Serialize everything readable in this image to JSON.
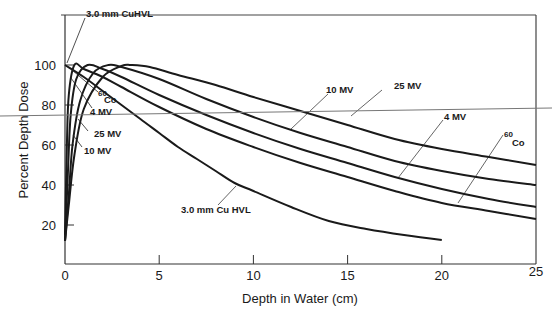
{
  "chart_data": {
    "type": "line",
    "title": "",
    "xlabel": "Depth in Water (cm)",
    "ylabel": "Percent Depth Dose",
    "xlim": [
      0,
      25
    ],
    "ylim": [
      0,
      110
    ],
    "x_ticks": [
      0,
      5,
      10,
      15,
      20,
      25
    ],
    "y_ticks": [
      20,
      40,
      60,
      80,
      100
    ],
    "grid": false,
    "legend": "inline labels with leader lines",
    "series": [
      {
        "name": "3.0 mm Cu HVL",
        "label_top": "3.0 mm CuHVL",
        "label_bottom": "3.0 mm Cu HVL",
        "x": [
          0,
          1,
          2,
          3,
          4,
          5,
          6,
          7,
          8,
          9,
          10,
          12,
          14,
          16,
          18,
          20
        ],
        "values": [
          100,
          94,
          87,
          80,
          73,
          66,
          59,
          53,
          47,
          41,
          37,
          29,
          22,
          18,
          15,
          12.5
        ]
      },
      {
        "name": "60Co",
        "label_sup": "60",
        "label_main": "Co",
        "x": [
          0,
          0.1,
          0.2,
          0.5,
          1,
          2,
          3,
          5,
          7.5,
          10,
          12.5,
          15,
          17.5,
          20,
          22.5,
          25
        ],
        "values": [
          15,
          60,
          85,
          100,
          98,
          94,
          89,
          79,
          68,
          59,
          51,
          44,
          37,
          31,
          27,
          23
        ]
      },
      {
        "name": "4 MV",
        "x": [
          0,
          0.15,
          0.3,
          0.6,
          1.2,
          2,
          3,
          5,
          7.5,
          10,
          12.5,
          15,
          17.5,
          20,
          22.5,
          25
        ],
        "values": [
          12,
          45,
          75,
          93,
          100,
          98,
          94,
          85,
          75,
          66,
          58,
          51,
          44,
          38,
          33,
          29
        ]
      },
      {
        "name": "10 MV",
        "x": [
          0,
          0.2,
          0.4,
          0.8,
          1.5,
          2.3,
          3,
          5,
          7.5,
          10,
          12.5,
          15,
          17.5,
          20,
          22.5,
          25
        ],
        "values": [
          12,
          35,
          60,
          82,
          96,
          100,
          99,
          93,
          83,
          74,
          66,
          59,
          52,
          47,
          43,
          40
        ]
      },
      {
        "name": "25 MV",
        "x": [
          0,
          0.2,
          0.5,
          1,
          2,
          3,
          3.5,
          4.5,
          6,
          8,
          10,
          12.5,
          15,
          17.5,
          20,
          22.5,
          25
        ],
        "values": [
          12,
          30,
          55,
          78,
          94,
          99.5,
          100,
          99,
          95,
          90,
          84,
          77,
          70,
          63,
          58,
          54,
          50
        ]
      }
    ],
    "annotations": [
      {
        "text": "3.0 mm CuHVL",
        "points_to": "3.0 mm Cu HVL curve at depth 0 (100%)"
      },
      {
        "text": "60 Co",
        "points_to": "60Co build-up region"
      },
      {
        "text": "4 MV",
        "points_to": "4 MV build-up region"
      },
      {
        "text": "25 MV",
        "points_to": "25 MV build-up region"
      },
      {
        "text": "10 MV",
        "points_to": "10 MV build-up region"
      },
      {
        "text": "10 MV",
        "points_to": "10 MV curve near 14 cm"
      },
      {
        "text": "25 MV",
        "points_to": "25 MV curve near 19 cm"
      },
      {
        "text": "4 MV",
        "points_to": "4 MV curve near 18 cm"
      },
      {
        "text": "60 Co",
        "points_to": "60Co curve near 21 cm"
      },
      {
        "text": "3.0 mm Cu HVL",
        "points_to": "3.0 mm Cu HVL curve near 9 cm"
      }
    ]
  },
  "axes": {
    "x_label": "Depth in Water (cm)",
    "y_label": "Percent Depth Dose",
    "x_ticks": [
      "0",
      "5",
      "10",
      "15",
      "20",
      "25"
    ],
    "y_ticks": [
      "20",
      "40",
      "60",
      "80",
      "100"
    ]
  },
  "labels": {
    "hvl_top": "3.0 mm CuHVL",
    "co_sup": "60",
    "co_main": "Co",
    "mv4_left": "4 MV",
    "mv25_left": "25 MV",
    "mv10_left": "10 MV",
    "mv10_right": "10 MV",
    "mv25_right": "25 MV",
    "mv4_right": "4 MV",
    "co_right_sup": "60",
    "co_right_main": "Co",
    "hvl_bottom": "3.0 mm Cu HVL"
  },
  "colors": {
    "ink": "#1a1a1a",
    "frame": "#444444",
    "stray_line": "#777777",
    "background": "#ffffff"
  }
}
